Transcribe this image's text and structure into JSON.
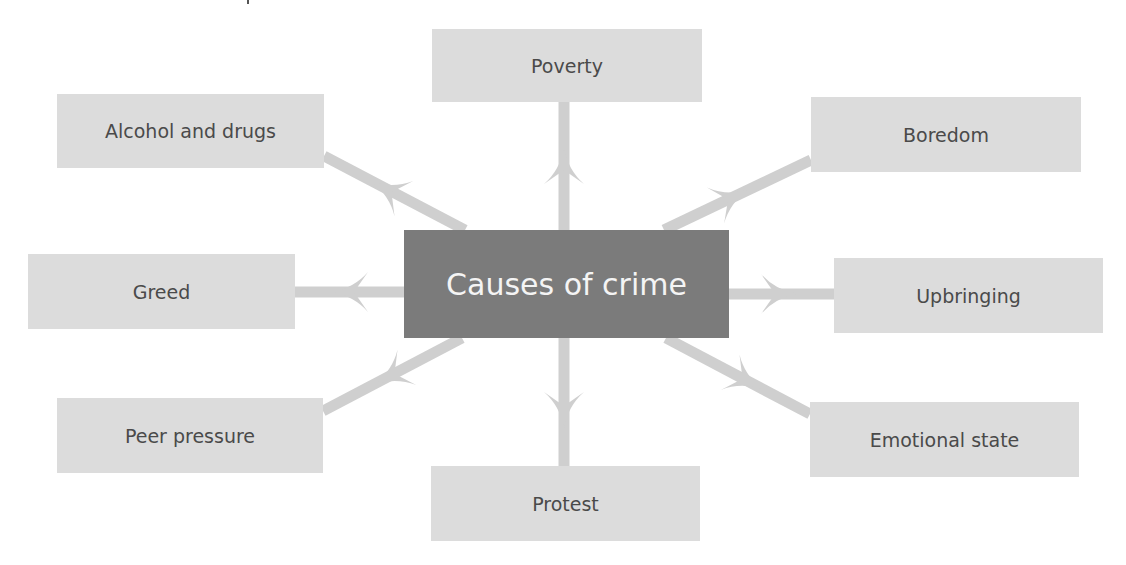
{
  "diagram": {
    "center": {
      "label": "Causes of crime",
      "box": [
        404,
        230,
        325,
        108
      ],
      "color": "#7b7b7b",
      "text_color": "#f4f4f4"
    },
    "node_color": "#dcdcdc",
    "node_text_color": "#4a4a4a",
    "arrow_color": "#cfcfcf",
    "nodes": [
      {
        "id": "poverty",
        "label": "Poverty",
        "box": [
          432,
          29,
          270,
          73
        ]
      },
      {
        "id": "alcohol-and-drugs",
        "label": "Alcohol and drugs",
        "box": [
          57,
          94,
          267,
          74
        ]
      },
      {
        "id": "boredom",
        "label": "Boredom",
        "box": [
          811,
          97,
          270,
          75
        ]
      },
      {
        "id": "greed",
        "label": "Greed",
        "box": [
          28,
          254,
          267,
          75
        ]
      },
      {
        "id": "upbringing",
        "label": "Upbringing",
        "box": [
          834,
          258,
          269,
          75
        ]
      },
      {
        "id": "peer-pressure",
        "label": "Peer pressure",
        "box": [
          57,
          398,
          266,
          75
        ]
      },
      {
        "id": "protest",
        "label": "Protest",
        "box": [
          431,
          466,
          269,
          75
        ]
      },
      {
        "id": "emotional-state",
        "label": "Emotional state",
        "box": [
          810,
          402,
          269,
          75
        ]
      }
    ],
    "arrows": [
      {
        "to": "poverty",
        "from_xy": [
          564,
          230
        ],
        "to_xy": [
          564,
          102
        ],
        "head_xy": [
          564,
          148
        ]
      },
      {
        "to": "alcohol-and-drugs",
        "from_xy": [
          465,
          230
        ],
        "to_xy": [
          324,
          156
        ],
        "head_xy": [
          372,
          182
        ]
      },
      {
        "to": "boredom",
        "from_xy": [
          664,
          230
        ],
        "to_xy": [
          811,
          160
        ],
        "head_xy": [
          748,
          190
        ]
      },
      {
        "to": "greed",
        "from_xy": [
          404,
          292
        ],
        "to_xy": [
          295,
          292
        ],
        "head_xy": [
          332,
          292
        ]
      },
      {
        "to": "upbringing",
        "from_xy": [
          729,
          294
        ],
        "to_xy": [
          834,
          294
        ],
        "head_xy": [
          797,
          294
        ]
      },
      {
        "to": "peer-pressure",
        "from_xy": [
          462,
          338
        ],
        "to_xy": [
          323,
          411
        ],
        "head_xy": [
          375,
          384
        ]
      },
      {
        "to": "protest",
        "from_xy": [
          564,
          338
        ],
        "to_xy": [
          564,
          466
        ],
        "head_xy": [
          564,
          428
        ]
      },
      {
        "to": "emotional-state",
        "from_xy": [
          666,
          338
        ],
        "to_xy": [
          810,
          414
        ],
        "head_xy": [
          762,
          389
        ]
      }
    ]
  }
}
